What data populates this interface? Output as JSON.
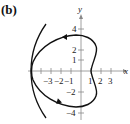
{
  "figure": {
    "label": "(b)",
    "x_axis_label": "x",
    "y_axis_label": "y",
    "x_ticks": [
      {
        "value": -3,
        "label": "−3"
      },
      {
        "value": -2,
        "label": "−2"
      },
      {
        "value": -1,
        "label": "−1"
      },
      {
        "value": 1,
        "label": "1"
      },
      {
        "value": 2,
        "label": "2"
      },
      {
        "value": 3,
        "label": "3"
      }
    ],
    "y_ticks": [
      {
        "value": 4,
        "label": "4"
      },
      {
        "value": 2,
        "label": "2"
      },
      {
        "value": 1,
        "label": "1"
      },
      {
        "value": -2,
        "label": "−2"
      },
      {
        "value": -4,
        "label": "−4"
      }
    ],
    "colors": {
      "curve": "#111111",
      "axis": "#888888"
    }
  }
}
